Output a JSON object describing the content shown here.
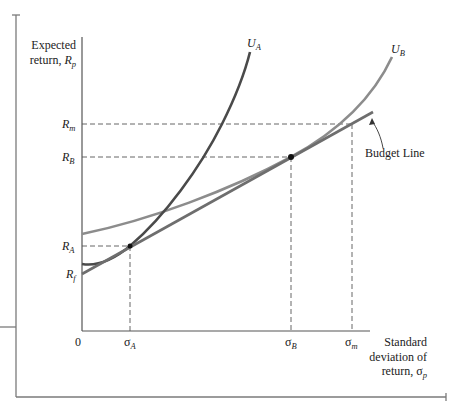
{
  "diagram": {
    "y_axis_label_line1": "Expected",
    "y_axis_label_line2": "return, ",
    "y_axis_symbol": "R",
    "y_axis_symbol_sub": "p",
    "x_axis_label_line1": "Standard",
    "x_axis_label_line2": "deviation of",
    "x_axis_label_line3": "return, ",
    "x_axis_symbol": "σ",
    "x_axis_symbol_sub": "p",
    "origin_label": "0",
    "y_ticks": [
      {
        "symbol": "R",
        "sub": "m"
      },
      {
        "symbol": "R",
        "sub": "B"
      },
      {
        "symbol": "R",
        "sub": "A"
      },
      {
        "symbol": "R",
        "sub": "f"
      }
    ],
    "x_ticks": [
      {
        "symbol": "σ",
        "sub": "A"
      },
      {
        "symbol": "σ",
        "sub": "B"
      },
      {
        "symbol": "σ",
        "sub": "m"
      }
    ],
    "curves": {
      "ua": {
        "symbol": "U",
        "sub": "A",
        "color": "#4a4a4a"
      },
      "ub": {
        "symbol": "U",
        "sub": "B",
        "color": "#8c8c8c"
      },
      "budget": {
        "label": "Budget Line",
        "color": "#6e6e6e"
      }
    },
    "points": {
      "a": "tangency A",
      "b": "tangency B"
    }
  }
}
